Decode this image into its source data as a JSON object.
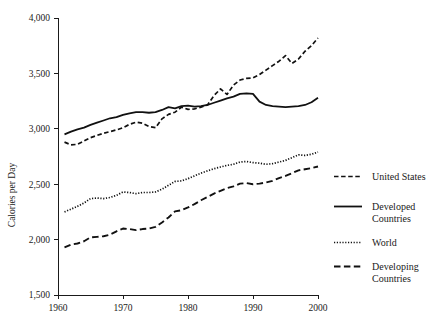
{
  "chart_data": {
    "type": "line",
    "title": "",
    "subtitle": "",
    "xlabel": "",
    "ylabel": "Calories per Day",
    "xlim": [
      1960,
      2000
    ],
    "ylim": [
      1500,
      4000
    ],
    "grid": false,
    "legend_position": "right",
    "x_ticks": [
      "1960",
      "1970",
      "1980",
      "1990",
      "2000"
    ],
    "x_tick_values": [
      1960,
      1970,
      1980,
      1990,
      2000
    ],
    "y_ticks": [
      "1,500",
      "2,000",
      "2,500",
      "3,000",
      "3,500",
      "4,000"
    ],
    "y_tick_values": [
      1500,
      2000,
      2500,
      3000,
      3500,
      4000
    ],
    "x": [
      1961,
      1962,
      1963,
      1964,
      1965,
      1966,
      1967,
      1968,
      1969,
      1970,
      1971,
      1972,
      1973,
      1974,
      1975,
      1976,
      1977,
      1978,
      1979,
      1980,
      1981,
      1982,
      1983,
      1984,
      1985,
      1986,
      1987,
      1988,
      1989,
      1990,
      1991,
      1992,
      1993,
      1994,
      1995,
      1996,
      1997,
      1998,
      1999,
      2000
    ],
    "series": [
      {
        "name": "United States",
        "style": "dashed",
        "color": "#111111",
        "values": [
          2880,
          2855,
          2860,
          2890,
          2920,
          2940,
          2960,
          2975,
          2990,
          3010,
          3040,
          3060,
          3050,
          3020,
          3010,
          3090,
          3130,
          3150,
          3195,
          3175,
          3180,
          3195,
          3215,
          3300,
          3360,
          3310,
          3395,
          3440,
          3455,
          3460,
          3490,
          3530,
          3570,
          3610,
          3660,
          3590,
          3630,
          3700,
          3750,
          3820
        ]
      },
      {
        "name": "Developed Countries",
        "style": "solid",
        "color": "#111111",
        "values": [
          2950,
          2975,
          2995,
          3010,
          3035,
          3055,
          3075,
          3095,
          3105,
          3125,
          3140,
          3150,
          3150,
          3145,
          3150,
          3170,
          3195,
          3185,
          3205,
          3210,
          3200,
          3205,
          3215,
          3235,
          3255,
          3275,
          3290,
          3315,
          3320,
          3315,
          3245,
          3215,
          3205,
          3200,
          3195,
          3200,
          3205,
          3215,
          3240,
          3280
        ]
      },
      {
        "name": "World",
        "style": "dotted",
        "color": "#111111",
        "values": [
          2250,
          2275,
          2300,
          2330,
          2370,
          2375,
          2370,
          2380,
          2400,
          2430,
          2425,
          2415,
          2425,
          2425,
          2430,
          2455,
          2490,
          2525,
          2530,
          2550,
          2575,
          2600,
          2620,
          2640,
          2655,
          2670,
          2680,
          2700,
          2705,
          2695,
          2690,
          2680,
          2685,
          2700,
          2715,
          2740,
          2765,
          2760,
          2770,
          2790
        ]
      },
      {
        "name": "Developing Countries",
        "style": "longdash",
        "color": "#111111",
        "values": [
          1930,
          1955,
          1965,
          1985,
          2020,
          2025,
          2030,
          2045,
          2075,
          2100,
          2095,
          2085,
          2095,
          2100,
          2115,
          2155,
          2200,
          2255,
          2265,
          2290,
          2320,
          2355,
          2385,
          2415,
          2440,
          2465,
          2480,
          2505,
          2510,
          2500,
          2505,
          2515,
          2530,
          2555,
          2575,
          2600,
          2625,
          2635,
          2645,
          2660
        ]
      }
    ]
  },
  "legend": {
    "items": [
      {
        "label": "United States",
        "label_line2": "",
        "style": "dashed"
      },
      {
        "label": "Developed",
        "label_line2": "Countries",
        "style": "solid"
      },
      {
        "label": "World",
        "label_line2": "",
        "style": "dotted"
      },
      {
        "label": "Developing",
        "label_line2": "Countries",
        "style": "longdash"
      }
    ]
  },
  "axis": {
    "y_title": "Calories per Day"
  }
}
